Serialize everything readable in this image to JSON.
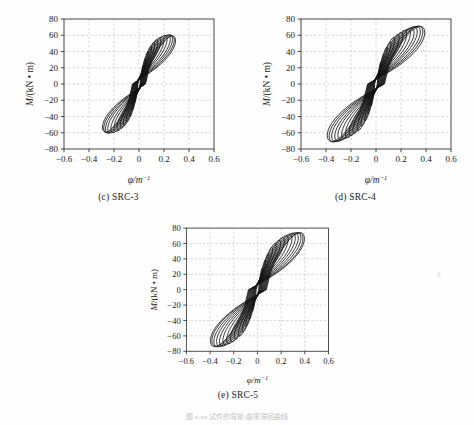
{
  "figure": {
    "bottom_caption": "图 x-xx   试件的弯矩-曲率滞回曲线",
    "background_color": "#fefefe",
    "line_color": "#111111",
    "grid_color": "#b9b9b9"
  },
  "charts": [
    {
      "key": "c",
      "caption": "(c) SRC-3",
      "chart_data": {
        "type": "line",
        "title": "(c) SRC-3",
        "xlabel": "φ/m",
        "xlabel_sup": "-1",
        "ylabel": "M/(kN • m)",
        "xlim": [
          -0.6,
          0.6
        ],
        "ylim": [
          -80,
          80
        ],
        "xticks": [
          -0.6,
          -0.4,
          -0.2,
          0,
          0.2,
          0.4,
          0.6
        ],
        "xticklabels": [
          "-0.6",
          "-0.4",
          "-0.2",
          "0",
          "0.2",
          "0.4",
          "0.6"
        ],
        "yticks": [
          -80,
          -60,
          -40,
          -20,
          0,
          20,
          40,
          60,
          80
        ],
        "yticklabels": [
          "-80",
          "-60",
          "-40",
          "-20",
          "0",
          "20",
          "40",
          "60",
          "80"
        ],
        "grid": true,
        "legend": "none",
        "series_description": "Pinched S-shaped moment-curvature hysteresis loops, progressively increasing amplitude",
        "loops": [
          {
            "amp_x": 0.035,
            "amp_y": 22,
            "pinch": 0.3,
            "slip": 0.01,
            "tilt": 0.5
          },
          {
            "amp_x": 0.055,
            "amp_y": 31,
            "pinch": 0.32,
            "slip": 0.014,
            "tilt": 0.5
          },
          {
            "amp_x": 0.075,
            "amp_y": 38,
            "pinch": 0.34,
            "slip": 0.018,
            "tilt": 0.5
          },
          {
            "amp_x": 0.1,
            "amp_y": 44,
            "pinch": 0.36,
            "slip": 0.022,
            "tilt": 0.5
          },
          {
            "amp_x": 0.125,
            "amp_y": 48,
            "pinch": 0.38,
            "slip": 0.026,
            "tilt": 0.5
          },
          {
            "amp_x": 0.15,
            "amp_y": 51,
            "pinch": 0.4,
            "slip": 0.03,
            "tilt": 0.5
          },
          {
            "amp_x": 0.175,
            "amp_y": 53,
            "pinch": 0.42,
            "slip": 0.034,
            "tilt": 0.5
          },
          {
            "amp_x": 0.2,
            "amp_y": 54,
            "pinch": 0.44,
            "slip": 0.038,
            "tilt": 0.5
          },
          {
            "amp_x": 0.225,
            "amp_y": 55,
            "pinch": 0.46,
            "slip": 0.042,
            "tilt": 0.5
          },
          {
            "amp_x": 0.25,
            "amp_y": 55,
            "pinch": 0.48,
            "slip": 0.046,
            "tilt": 0.5
          },
          {
            "amp_x": 0.268,
            "amp_y": 55,
            "pinch": 0.5,
            "slip": 0.05,
            "tilt": 0.5
          },
          {
            "amp_x": 0.282,
            "amp_y": 54,
            "pinch": 0.52,
            "slip": 0.054,
            "tilt": 0.5
          },
          {
            "amp_x": 0.292,
            "amp_y": 53,
            "pinch": 0.54,
            "slip": 0.058,
            "tilt": 0.5
          }
        ],
        "x_extent": [
          -0.3,
          0.3
        ],
        "y_extent": [
          -57,
          57
        ]
      }
    },
    {
      "key": "d",
      "caption": "(d) SRC-4",
      "chart_data": {
        "type": "line",
        "title": "(d) SRC-4",
        "xlabel": "φ/m",
        "xlabel_sup": "-1",
        "ylabel": "M/(kN • m)",
        "xlim": [
          -0.6,
          0.6
        ],
        "ylim": [
          -80,
          80
        ],
        "xticks": [
          -0.6,
          -0.4,
          -0.2,
          0,
          0.2,
          0.4,
          0.6
        ],
        "xticklabels": [
          "-0.6",
          "-0.4",
          "-0.2",
          "0",
          "0.2",
          "0.4",
          "0.6"
        ],
        "yticks": [
          -80,
          -60,
          -40,
          -20,
          0,
          20,
          40,
          60,
          80
        ],
        "yticklabels": [
          "-80",
          "-60",
          "-40",
          "-20",
          "0",
          "20",
          "40",
          "60",
          "80"
        ],
        "grid": true,
        "legend": "none",
        "series_description": "Pinched S-shaped moment-curvature hysteresis loops, wider than SRC-3",
        "loops": [
          {
            "amp_x": 0.04,
            "amp_y": 26,
            "pinch": 0.3,
            "slip": 0.012,
            "tilt": 0.5
          },
          {
            "amp_x": 0.065,
            "amp_y": 35,
            "pinch": 0.32,
            "slip": 0.016,
            "tilt": 0.5
          },
          {
            "amp_x": 0.09,
            "amp_y": 43,
            "pinch": 0.34,
            "slip": 0.02,
            "tilt": 0.5
          },
          {
            "amp_x": 0.12,
            "amp_y": 49,
            "pinch": 0.36,
            "slip": 0.025,
            "tilt": 0.5
          },
          {
            "amp_x": 0.15,
            "amp_y": 54,
            "pinch": 0.38,
            "slip": 0.03,
            "tilt": 0.5
          },
          {
            "amp_x": 0.185,
            "amp_y": 57,
            "pinch": 0.4,
            "slip": 0.035,
            "tilt": 0.5
          },
          {
            "amp_x": 0.215,
            "amp_y": 59,
            "pinch": 0.42,
            "slip": 0.04,
            "tilt": 0.5
          },
          {
            "amp_x": 0.245,
            "amp_y": 61,
            "pinch": 0.44,
            "slip": 0.045,
            "tilt": 0.5
          },
          {
            "amp_x": 0.275,
            "amp_y": 62,
            "pinch": 0.46,
            "slip": 0.05,
            "tilt": 0.5
          },
          {
            "amp_x": 0.305,
            "amp_y": 63,
            "pinch": 0.48,
            "slip": 0.055,
            "tilt": 0.5
          },
          {
            "amp_x": 0.33,
            "amp_y": 64,
            "pinch": 0.5,
            "slip": 0.06,
            "tilt": 0.5
          },
          {
            "amp_x": 0.355,
            "amp_y": 64,
            "pinch": 0.52,
            "slip": 0.065,
            "tilt": 0.5
          },
          {
            "amp_x": 0.375,
            "amp_y": 64,
            "pinch": 0.54,
            "slip": 0.07,
            "tilt": 0.5
          },
          {
            "amp_x": 0.39,
            "amp_y": 63,
            "pinch": 0.56,
            "slip": 0.075,
            "tilt": 0.5
          }
        ],
        "x_extent": [
          -0.41,
          0.38
        ],
        "y_extent": [
          -65,
          65
        ]
      }
    },
    {
      "key": "e",
      "caption": "(e) SRC-5",
      "chart_data": {
        "type": "line",
        "title": "(e) SRC-5",
        "xlabel": "φ/m",
        "xlabel_sup": "-1",
        "ylabel": "M/(kN • m)",
        "xlim": [
          -0.6,
          0.6
        ],
        "ylim": [
          -80,
          80
        ],
        "xticks": [
          -0.6,
          -0.4,
          -0.2,
          0,
          0.2,
          0.4,
          0.6
        ],
        "xticklabels": [
          "-0.6",
          "-0.4",
          "-0.2",
          "0",
          "0.2",
          "0.4",
          "0.6"
        ],
        "yticks": [
          -80,
          -60,
          -40,
          -20,
          0,
          20,
          40,
          60,
          80
        ],
        "yticklabels": [
          "-80",
          "-60",
          "-40",
          "-20",
          "0",
          "20",
          "40",
          "60",
          "80"
        ],
        "grid": true,
        "legend": "none",
        "series_description": "Pinched S-shaped moment-curvature hysteresis loops, widest set",
        "loops": [
          {
            "amp_x": 0.042,
            "amp_y": 27,
            "pinch": 0.3,
            "slip": 0.012,
            "tilt": 0.5
          },
          {
            "amp_x": 0.07,
            "amp_y": 37,
            "pinch": 0.32,
            "slip": 0.017,
            "tilt": 0.5
          },
          {
            "amp_x": 0.098,
            "amp_y": 45,
            "pinch": 0.34,
            "slip": 0.022,
            "tilt": 0.5
          },
          {
            "amp_x": 0.128,
            "amp_y": 52,
            "pinch": 0.36,
            "slip": 0.027,
            "tilt": 0.5
          },
          {
            "amp_x": 0.16,
            "amp_y": 57,
            "pinch": 0.38,
            "slip": 0.032,
            "tilt": 0.5
          },
          {
            "amp_x": 0.195,
            "amp_y": 60,
            "pinch": 0.4,
            "slip": 0.037,
            "tilt": 0.5
          },
          {
            "amp_x": 0.228,
            "amp_y": 63,
            "pinch": 0.42,
            "slip": 0.042,
            "tilt": 0.5
          },
          {
            "amp_x": 0.26,
            "amp_y": 65,
            "pinch": 0.44,
            "slip": 0.048,
            "tilt": 0.5
          },
          {
            "amp_x": 0.292,
            "amp_y": 66,
            "pinch": 0.46,
            "slip": 0.054,
            "tilt": 0.5
          },
          {
            "amp_x": 0.32,
            "amp_y": 67,
            "pinch": 0.48,
            "slip": 0.06,
            "tilt": 0.5
          },
          {
            "amp_x": 0.345,
            "amp_y": 67,
            "pinch": 0.5,
            "slip": 0.066,
            "tilt": 0.5
          },
          {
            "amp_x": 0.368,
            "amp_y": 67,
            "pinch": 0.52,
            "slip": 0.072,
            "tilt": 0.5
          },
          {
            "amp_x": 0.385,
            "amp_y": 66,
            "pinch": 0.54,
            "slip": 0.078,
            "tilt": 0.5
          },
          {
            "amp_x": 0.397,
            "amp_y": 66,
            "pinch": 0.56,
            "slip": 0.084,
            "tilt": 0.5
          }
        ],
        "x_extent": [
          -0.42,
          0.4
        ],
        "y_extent": [
          -69,
          68
        ]
      }
    }
  ]
}
